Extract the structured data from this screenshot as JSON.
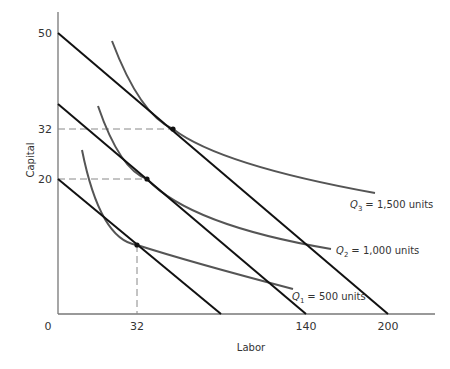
{
  "chart_data": {
    "type": "line",
    "title": "",
    "xlabel": "Labor",
    "ylabel": "Capital",
    "origin_label": "0",
    "x_ticks": [
      "32",
      "140",
      "200"
    ],
    "y_ticks": [
      "50",
      "32",
      "20"
    ],
    "grid": false,
    "isocost_lines": [
      {
        "name": "isocost-low",
        "y_intercept": 20,
        "x_intercept": null
      },
      {
        "name": "isocost-mid",
        "y_intercept": null,
        "x_intercept": 140
      },
      {
        "name": "isocost-high",
        "y_intercept": 50,
        "x_intercept": 200
      }
    ],
    "isoquants": [
      {
        "name": "Q1",
        "subscript": "1",
        "value_text": "= 500 units",
        "tangent": {
          "labor": 32,
          "capital": null
        }
      },
      {
        "name": "Q2",
        "subscript": "2",
        "value_text": "= 1,000 units",
        "tangent": {
          "labor": null,
          "capital": 20
        }
      },
      {
        "name": "Q3",
        "subscript": "3",
        "value_text": "= 1,500 units",
        "tangent": {
          "labor": null,
          "capital": 32
        }
      }
    ],
    "colors": {
      "isocost": "#111111",
      "isoquant": "#555555",
      "axis": "#777777",
      "guide": "#888888"
    }
  }
}
